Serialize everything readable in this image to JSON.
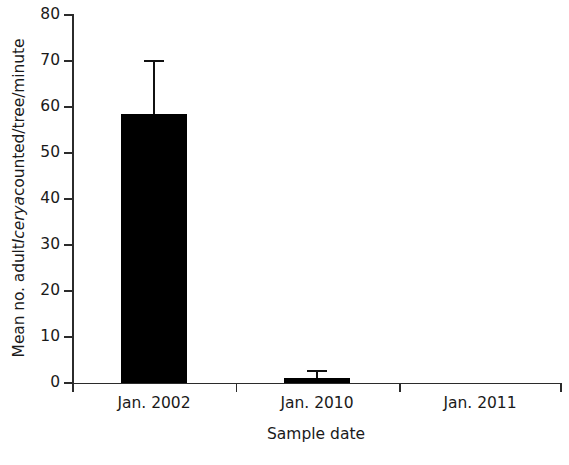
{
  "chart_data": {
    "type": "bar",
    "title": "",
    "subtitle": "",
    "xlabel": "Sample date",
    "ylabel_parts": {
      "before": "Mean no. adult ",
      "italic": "Icerya",
      "after": " counted/tree/minute"
    },
    "ylabel": "Mean no. adult Icerya counted/tree/minute",
    "categories": [
      "Jan. 2002",
      "Jan. 2010",
      "Jan. 2011"
    ],
    "values": [
      58.5,
      1.1,
      0
    ],
    "errors_upper": [
      11.5,
      1.5,
      0
    ],
    "error_type": "upper-only",
    "ylim": [
      0,
      80
    ],
    "ytick_values": [
      0,
      10,
      20,
      30,
      40,
      50,
      60,
      70,
      80
    ],
    "ytick_labels": [
      "0",
      "10",
      "20",
      "30",
      "40",
      "50",
      "60",
      "70",
      "80"
    ],
    "grid": false,
    "legend": null,
    "bar_color": "#000000",
    "axis_color": "#2b2b2b",
    "background": "#ffffff",
    "annotations": []
  },
  "layout": {
    "bar_width_px": 66,
    "category_centers_px": [
      82,
      245,
      408
    ],
    "x_tick_positions_px": [
      0,
      163.5,
      327,
      488
    ],
    "errorbar_cap_width_px": 20
  }
}
